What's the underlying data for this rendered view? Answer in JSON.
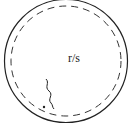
{
  "diagram": {
    "center_label": "r/s",
    "outer_circle": {
      "style": "solid",
      "color": "#222222"
    },
    "inner_circle": {
      "style": "dashed",
      "color": "#333333"
    },
    "wavy_line": {
      "color": "#222222"
    },
    "dot": {
      "color": "#222222"
    }
  }
}
